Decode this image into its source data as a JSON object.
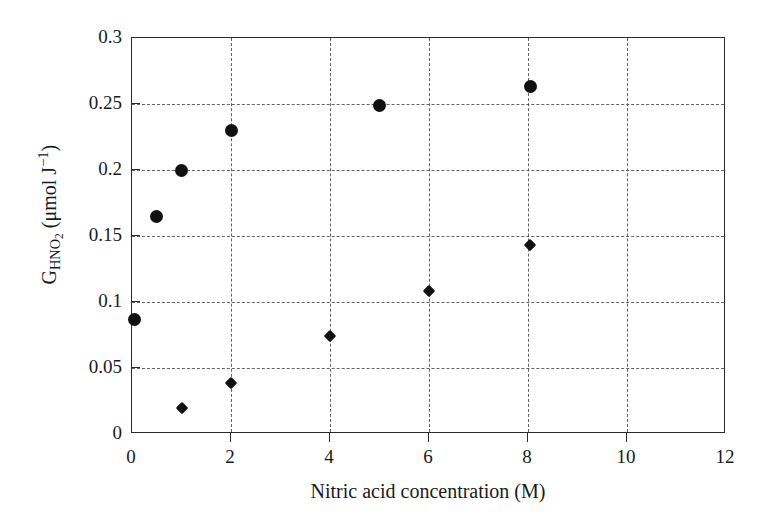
{
  "chart_data": {
    "type": "scatter",
    "title": "",
    "xlabel": "Nitric acid concentration (M)",
    "ylabel_parts": {
      "base": "G",
      "subscript": "HNO2",
      "units_open": " (μmol J",
      "units_sup": "−1",
      "units_close": ")"
    },
    "ylabel": "G_HNO2 (μmol J⁻¹)",
    "xlim": [
      0,
      12
    ],
    "ylim": [
      0,
      0.3
    ],
    "xticks": [
      0,
      2,
      4,
      6,
      8,
      10,
      12
    ],
    "xtick_labels": [
      "0",
      "2",
      "4",
      "6",
      "8",
      "10",
      "12"
    ],
    "yticks": [
      0,
      0.05,
      0.1,
      0.15,
      0.2,
      0.25,
      0.3
    ],
    "ytick_labels": [
      "0",
      "0.05",
      "0.1",
      "0.15",
      "0.2",
      "0.25",
      "0.3"
    ],
    "grid": true,
    "grid_style": "dashed",
    "grid_color": "#4a4a4a",
    "legend": "none",
    "marker_color": "#111111",
    "series": [
      {
        "name": "circles",
        "marker": "circle",
        "marker_size": 13,
        "points": [
          {
            "x": 0.05,
            "y": 0.087
          },
          {
            "x": 0.5,
            "y": 0.165
          },
          {
            "x": 1.0,
            "y": 0.2
          },
          {
            "x": 2.0,
            "y": 0.23
          },
          {
            "x": 5.0,
            "y": 0.249
          },
          {
            "x": 8.05,
            "y": 0.263
          }
        ]
      },
      {
        "name": "diamonds",
        "marker": "diamond",
        "marker_size": 9,
        "points": [
          {
            "x": 1.0,
            "y": 0.02
          },
          {
            "x": 2.0,
            "y": 0.039
          },
          {
            "x": 4.0,
            "y": 0.074
          },
          {
            "x": 6.0,
            "y": 0.108
          },
          {
            "x": 8.05,
            "y": 0.143
          }
        ]
      }
    ]
  }
}
